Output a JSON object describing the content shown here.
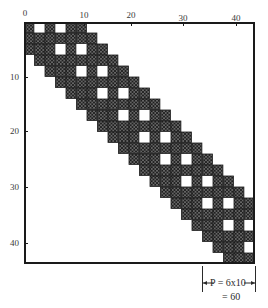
{
  "figure": {
    "x_axis": {
      "ticks": [
        {
          "label": "0",
          "value": 0,
          "px": 25
        },
        {
          "label": "10",
          "value": 10,
          "px": 84
        },
        {
          "label": "20",
          "value": 20,
          "px": 131
        },
        {
          "label": "30",
          "value": 30,
          "px": 183
        },
        {
          "label": "40",
          "value": 40,
          "px": 236
        }
      ]
    },
    "y_axis": {
      "ticks": [
        {
          "label": "10",
          "value": 10,
          "px": 77
        },
        {
          "label": "20",
          "value": 20,
          "px": 131
        },
        {
          "label": "30",
          "value": 30,
          "px": 187
        },
        {
          "label": "40",
          "value": 40,
          "px": 243
        }
      ]
    },
    "matrix": {
      "description": "banded block sparse matrix, diagonal band of cross-hatched 2x2 blocks with stair-step white notches",
      "grid_cells": 22,
      "band_lower": 3,
      "band_upper": 4,
      "fill_color": "#1a1a1a",
      "empty_color": "#ffffff"
    },
    "annotation": {
      "line1": "P = 6x10",
      "line2": "= 60"
    }
  }
}
